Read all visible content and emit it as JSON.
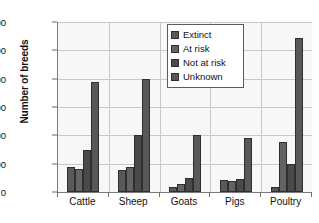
{
  "chart_data": {
    "type": "bar",
    "title": "",
    "xlabel": "",
    "ylabel": "Number of breeds",
    "categories": [
      "Cattle",
      "Sheep",
      "Goats",
      "Pigs",
      "Poultry"
    ],
    "series": [
      {
        "name": "Extinct",
        "color": "#595959",
        "values": [
          180,
          155,
          35,
          85,
          35
        ]
      },
      {
        "name": "At risk",
        "color": "#636363",
        "values": [
          160,
          180,
          60,
          80,
          350
        ]
      },
      {
        "name": "Not at risk",
        "color": "#4a4a4a",
        "values": [
          300,
          400,
          100,
          90,
          200
        ]
      },
      {
        "name": "Unknown",
        "color": "#585858",
        "values": [
          775,
          795,
          405,
          380,
          1090
        ]
      }
    ],
    "ylim": [
      0,
      1200
    ],
    "y_ticks": [
      0,
      200,
      400,
      600,
      800,
      1000,
      1200
    ],
    "y_tick_labels": [
      "0",
      "200",
      "400",
      "600",
      "800",
      "1,000",
      "1,200"
    ],
    "grid": true,
    "legend_position": "top-center",
    "legend_entries": [
      "Extinct",
      "At risk",
      "Not at risk",
      "Unknown"
    ],
    "plot_background": "#f7f7f7",
    "gridline_color": "#c8c8c8",
    "axis_color": "#7a7a7a"
  }
}
